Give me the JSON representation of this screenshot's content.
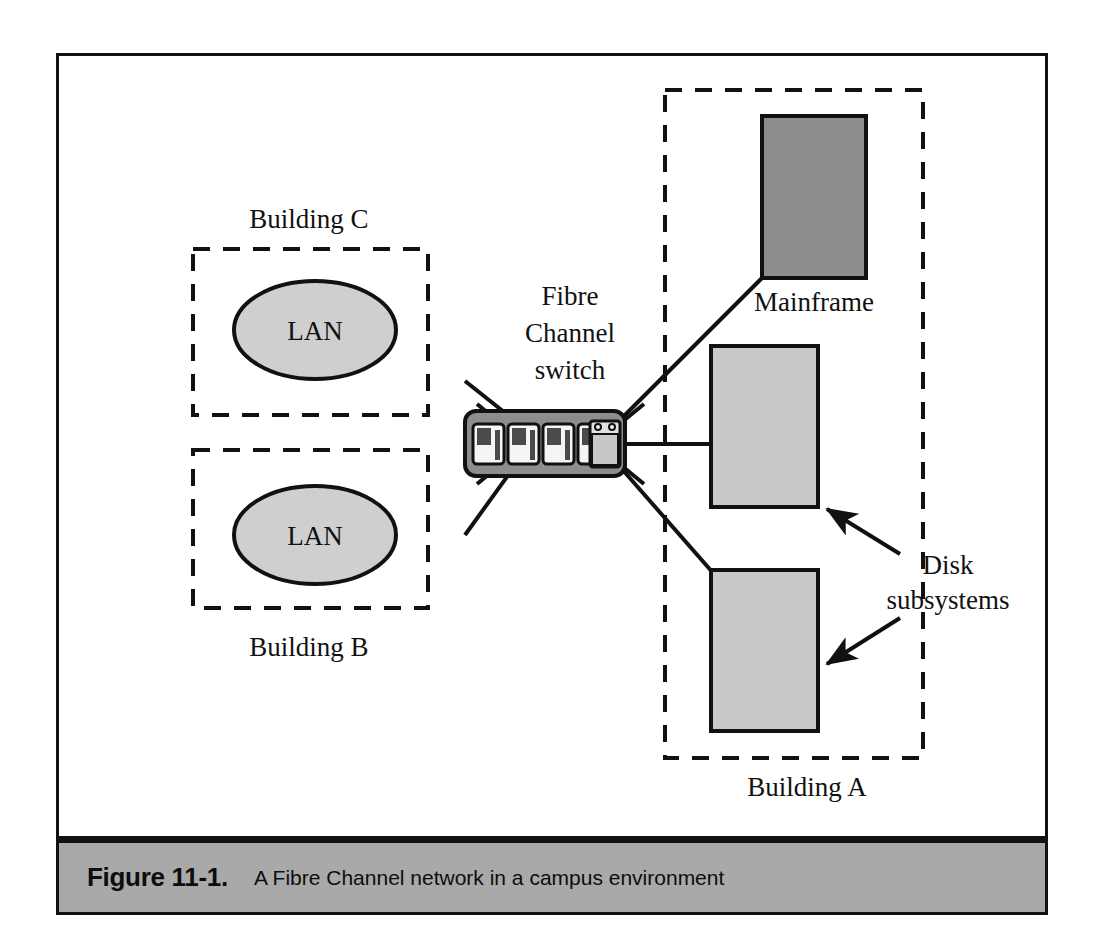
{
  "figure": {
    "caption_label": "Figure 11-1.",
    "caption_text": "A Fibre Channel network in a campus environment"
  },
  "diagram": {
    "title": "A Fibre Channel network in a campus environment",
    "buildings": [
      {
        "id": "building-c",
        "label": "Building C",
        "label_position": "above",
        "contains": "LAN"
      },
      {
        "id": "building-b",
        "label": "Building B",
        "label_position": "below",
        "contains": "LAN"
      },
      {
        "id": "building-a",
        "label": "Building A",
        "label_position": "below",
        "contains": "Mainframe and disk subsystems"
      }
    ],
    "nodes": {
      "lan_top": "LAN",
      "lan_bottom": "LAN",
      "mainframe": "Mainframe",
      "disk_subsystems": "Disk subsystems",
      "disk_subsystems_line1": "Disk",
      "disk_subsystems_line2": "subsystems"
    },
    "switch": {
      "label_line1": "Fibre",
      "label_line2": "Channel",
      "label_line3": "switch",
      "port_count": 4,
      "has_control_module": true,
      "led_count": 2
    },
    "colors": {
      "ink": "#111111",
      "lan_fill": "#cfcfcf",
      "mainframe_fill": "#8d8d8d",
      "disk_fill": "#c9c9c9",
      "switch_body": "#8d8d8d",
      "switch_port": "#f2f2f2",
      "switch_port_inset": "#4a4a4a",
      "caption_bar": "#a9a9a9",
      "page_background": "#ffffff"
    }
  }
}
